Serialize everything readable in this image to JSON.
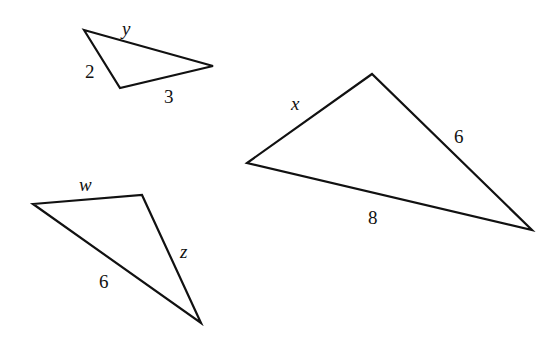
{
  "diagram": {
    "stroke_color": "#111111",
    "background": "#ffffff",
    "triangles": [
      {
        "id": "small-triangle",
        "points": "84,30 120,88 213,66",
        "labels": [
          {
            "text": "y",
            "x": 122,
            "y": 35,
            "italic": true
          },
          {
            "text": "2",
            "x": 85,
            "y": 78,
            "italic": false
          },
          {
            "text": "3",
            "x": 164,
            "y": 103,
            "italic": false
          }
        ]
      },
      {
        "id": "large-triangle",
        "points": "372,74 247,163 532,230",
        "labels": [
          {
            "text": "x",
            "x": 291,
            "y": 110,
            "italic": true
          },
          {
            "text": "6",
            "x": 454,
            "y": 143,
            "italic": false
          },
          {
            "text": "8",
            "x": 368,
            "y": 224,
            "italic": false
          }
        ]
      },
      {
        "id": "bottom-left-triangle",
        "points": "33,204 142,195 201,323",
        "labels": [
          {
            "text": "w",
            "x": 79,
            "y": 191,
            "italic": true
          },
          {
            "text": "z",
            "x": 180,
            "y": 258,
            "italic": true
          },
          {
            "text": "6",
            "x": 99,
            "y": 288,
            "italic": false
          }
        ]
      }
    ]
  }
}
